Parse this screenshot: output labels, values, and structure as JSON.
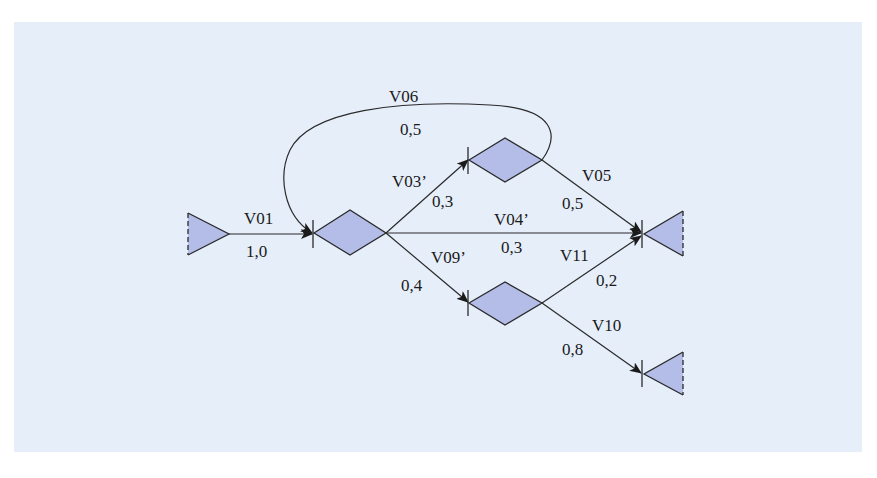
{
  "colors": {
    "panel_background": "#e6eefa",
    "node_fill": "#b4bde8",
    "stroke": "#2a2a2a"
  },
  "nodes": {
    "source": {
      "type": "source-triangle"
    },
    "n1": {
      "type": "decision-diamond"
    },
    "n2": {
      "type": "decision-diamond"
    },
    "n3": {
      "type": "decision-diamond"
    },
    "sink_a": {
      "type": "sink-triangle"
    },
    "sink_b": {
      "type": "sink-triangle"
    }
  },
  "edges": {
    "v01": {
      "name": "V01",
      "prob": "1,0",
      "from": "source",
      "to": "n1"
    },
    "v06": {
      "name": "V06",
      "prob": "0,5",
      "from": "n2",
      "to": "n1"
    },
    "v03": {
      "name": "V03’",
      "prob": "0,3",
      "from": "n1",
      "to": "n2"
    },
    "v05": {
      "name": "V05",
      "prob": "0,5",
      "from": "n2",
      "to": "sink_a"
    },
    "v04": {
      "name": "V04’",
      "prob": "0,3",
      "from": "n1",
      "to": "sink_a"
    },
    "v09": {
      "name": "V09’",
      "prob": "0,4",
      "from": "n1",
      "to": "n3"
    },
    "v11": {
      "name": "V11",
      "prob": "0,2",
      "from": "n3",
      "to": "sink_a"
    },
    "v10": {
      "name": "V10",
      "prob": "0,8",
      "from": "n3",
      "to": "sink_b"
    }
  }
}
